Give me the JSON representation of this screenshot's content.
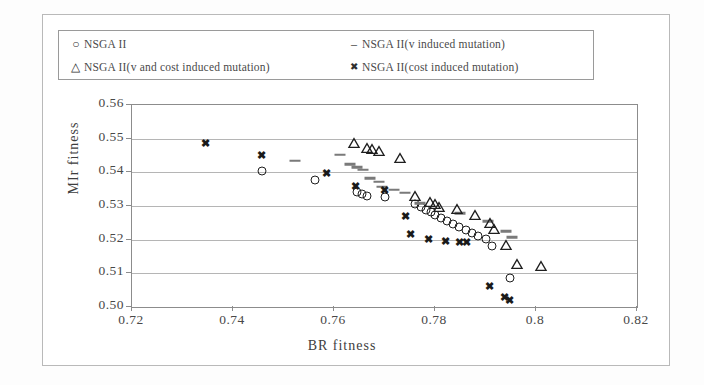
{
  "figure": {
    "background": "#ffffff",
    "border_color": "#b9b9b9"
  },
  "legend": {
    "border_color": "#9a9a9a",
    "entries": [
      {
        "marker": "circle-marker",
        "glyph": "○",
        "label": "NSGA II"
      },
      {
        "marker": "dash-marker",
        "glyph": "–",
        "label": "NSGA II(v induced mutation)"
      },
      {
        "marker": "triangle-marker",
        "glyph": "△",
        "label": "NSGA II(v and cost induced mutation)"
      },
      {
        "marker": "x-marker",
        "glyph": "✖",
        "label": "NSGA II(cost induced mutation)"
      }
    ]
  },
  "axes": {
    "x_label": "BR fitness",
    "y_label": "MIr fitness",
    "x_ticks": [
      "0.72",
      "0.74",
      "0.76",
      "0.78",
      "0.8",
      "0.82"
    ],
    "y_ticks": [
      "0.56",
      "0.55",
      "0.54",
      "0.53",
      "0.52",
      "0.51",
      "0.50"
    ],
    "grid_color": "#b5b5b5",
    "frame_color": "#8c8c8c"
  },
  "chart_data": {
    "type": "scatter",
    "title": "",
    "xlabel": "BR fitness",
    "ylabel": "MIr fitness",
    "xlim": [
      0.72,
      0.82
    ],
    "ylim": [
      0.5,
      0.56
    ],
    "xticks": [
      0.72,
      0.74,
      0.76,
      0.78,
      0.8,
      0.82
    ],
    "yticks": [
      0.5,
      0.51,
      0.52,
      0.53,
      0.54,
      0.55,
      0.56
    ],
    "grid": true,
    "legend_position": "top-inside",
    "series": [
      {
        "name": "NSGA II",
        "marker": "circle",
        "color": "#1e1e1e",
        "points": [
          [
            0.7457,
            0.5405
          ],
          [
            0.7562,
            0.5376
          ],
          [
            0.7646,
            0.5341
          ],
          [
            0.7656,
            0.5335
          ],
          [
            0.7665,
            0.5329
          ],
          [
            0.77,
            0.5326
          ],
          [
            0.776,
            0.5305
          ],
          [
            0.7772,
            0.5297
          ],
          [
            0.7782,
            0.5288
          ],
          [
            0.7792,
            0.5282
          ],
          [
            0.78,
            0.5273
          ],
          [
            0.7812,
            0.5264
          ],
          [
            0.7824,
            0.5256
          ],
          [
            0.7836,
            0.5247
          ],
          [
            0.7848,
            0.5238
          ],
          [
            0.7862,
            0.5229
          ],
          [
            0.7874,
            0.522
          ],
          [
            0.7886,
            0.5211
          ],
          [
            0.79,
            0.5202
          ],
          [
            0.7912,
            0.5182
          ],
          [
            0.7948,
            0.5085
          ]
        ]
      },
      {
        "name": "NSGA II(v induced mutation)",
        "marker": "dash",
        "color": "#7a7a7a",
        "points": [
          [
            0.7523,
            0.5434
          ],
          [
            0.7612,
            0.5452
          ],
          [
            0.7632,
            0.5424
          ],
          [
            0.7645,
            0.5415
          ],
          [
            0.7657,
            0.5408
          ],
          [
            0.7672,
            0.5382
          ],
          [
            0.769,
            0.5372
          ],
          [
            0.7696,
            0.5357
          ],
          [
            0.7718,
            0.5348
          ],
          [
            0.774,
            0.534
          ],
          [
            0.777,
            0.5308
          ],
          [
            0.785,
            0.5278
          ],
          [
            0.7905,
            0.5255
          ],
          [
            0.794,
            0.5225
          ],
          [
            0.7952,
            0.5207
          ]
        ]
      },
      {
        "name": "NSGA II(v and cost induced mutation)",
        "marker": "triangle",
        "color": "#1e1e1e",
        "points": [
          [
            0.764,
            0.5488
          ],
          [
            0.7665,
            0.5472
          ],
          [
            0.7675,
            0.5468
          ],
          [
            0.769,
            0.5462
          ],
          [
            0.773,
            0.5442
          ],
          [
            0.776,
            0.533
          ],
          [
            0.779,
            0.5312
          ],
          [
            0.78,
            0.5305
          ],
          [
            0.7808,
            0.5298
          ],
          [
            0.7843,
            0.5292
          ],
          [
            0.788,
            0.5272
          ],
          [
            0.7908,
            0.525
          ],
          [
            0.7916,
            0.5232
          ],
          [
            0.794,
            0.5185
          ],
          [
            0.7962,
            0.5128
          ],
          [
            0.801,
            0.5122
          ]
        ]
      },
      {
        "name": "NSGA II(cost induced mutation)",
        "marker": "x",
        "color": "#1a1a1a",
        "points": [
          [
            0.7345,
            0.5488
          ],
          [
            0.7457,
            0.5452
          ],
          [
            0.7586,
            0.5398
          ],
          [
            0.7643,
            0.536
          ],
          [
            0.77,
            0.5348
          ],
          [
            0.7742,
            0.527
          ],
          [
            0.7752,
            0.5218
          ],
          [
            0.7788,
            0.5202
          ],
          [
            0.782,
            0.5196
          ],
          [
            0.7848,
            0.5192
          ],
          [
            0.7862,
            0.5192
          ],
          [
            0.7908,
            0.5062
          ],
          [
            0.7938,
            0.503
          ],
          [
            0.7948,
            0.5022
          ]
        ]
      }
    ]
  }
}
